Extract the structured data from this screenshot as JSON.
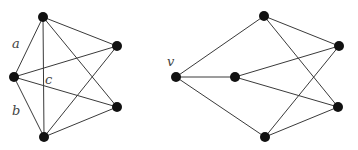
{
  "diagram": {
    "graphs": [
      {
        "id": "left-graph",
        "nodes": [
          {
            "id": "L_top",
            "x": 43,
            "y": 17
          },
          {
            "id": "L_left",
            "x": 14,
            "y": 77
          },
          {
            "id": "L_rt",
            "x": 117,
            "y": 46
          },
          {
            "id": "L_rb",
            "x": 117,
            "y": 107
          },
          {
            "id": "L_bottom",
            "x": 44,
            "y": 137
          }
        ],
        "edges": [
          [
            "L_top",
            "L_left"
          ],
          [
            "L_left",
            "L_bottom"
          ],
          [
            "L_top",
            "L_bottom"
          ],
          [
            "L_top",
            "L_rt"
          ],
          [
            "L_top",
            "L_rb"
          ],
          [
            "L_left",
            "L_rt"
          ],
          [
            "L_left",
            "L_rb"
          ],
          [
            "L_bottom",
            "L_rt"
          ],
          [
            "L_bottom",
            "L_rb"
          ]
        ],
        "labels": [
          {
            "text": "a",
            "x": 12,
            "y": 48
          },
          {
            "text": "b",
            "x": 12,
            "y": 115
          },
          {
            "text": "c",
            "x": 45,
            "y": 84
          }
        ]
      },
      {
        "id": "right-graph",
        "nodes": [
          {
            "id": "v",
            "x": 176,
            "y": 77
          },
          {
            "id": "R_mid",
            "x": 235,
            "y": 77
          },
          {
            "id": "R_top",
            "x": 264,
            "y": 16
          },
          {
            "id": "R_rt",
            "x": 339,
            "y": 46
          },
          {
            "id": "R_rb",
            "x": 338,
            "y": 107
          },
          {
            "id": "R_bottom",
            "x": 265,
            "y": 137
          }
        ],
        "edges": [
          [
            "v",
            "R_top"
          ],
          [
            "v",
            "R_mid"
          ],
          [
            "v",
            "R_bottom"
          ],
          [
            "R_mid",
            "R_rt"
          ],
          [
            "R_mid",
            "R_rb"
          ],
          [
            "R_top",
            "R_rt"
          ],
          [
            "R_top",
            "R_rb"
          ],
          [
            "R_bottom",
            "R_rt"
          ],
          [
            "R_bottom",
            "R_rb"
          ]
        ],
        "labels": [
          {
            "text": "v",
            "x": 167,
            "y": 66
          }
        ]
      }
    ]
  }
}
